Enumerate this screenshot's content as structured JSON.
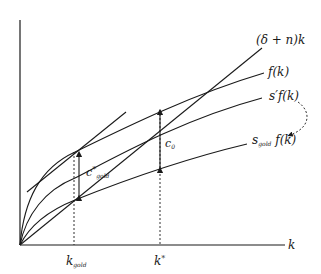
{
  "diagram": {
    "type": "solow-growth-golden-rule",
    "colors": {
      "line": "#1a1a1a",
      "background": "#ffffff"
    },
    "axes": {
      "x_label": "k",
      "ticks": [
        {
          "id": "k_gold",
          "base": "k",
          "sub": "gold"
        },
        {
          "id": "k_star",
          "base": "k",
          "sup": "*"
        }
      ]
    },
    "curves": [
      {
        "id": "depreciation_line",
        "label": "(δ + n)k"
      },
      {
        "id": "production",
        "label": "f(k)"
      },
      {
        "id": "savings_prime",
        "base": "s′f(k)"
      },
      {
        "id": "savings_gold",
        "base": "s",
        "sub": "gold",
        "tail": " f(k)"
      }
    ],
    "annotations": {
      "c_gold": {
        "base": "c",
        "sup": "*",
        "sub": "gold"
      },
      "c_0": {
        "base": "c",
        "sub": "0"
      }
    }
  }
}
